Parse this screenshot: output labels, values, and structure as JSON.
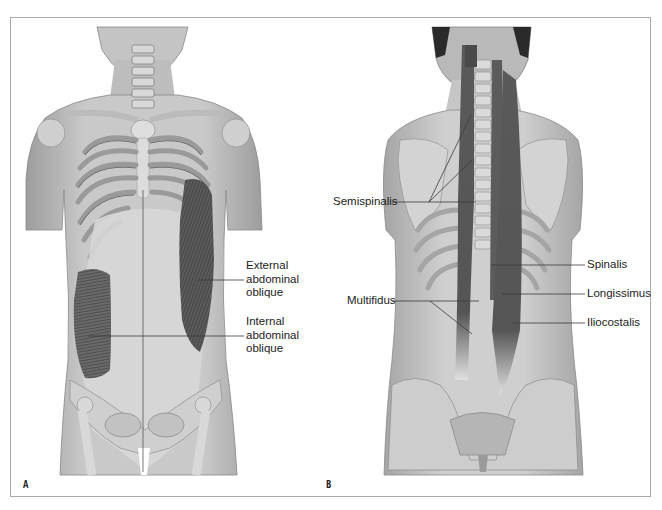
{
  "figure": {
    "panels": [
      {
        "letter": "A",
        "view": "anterior torso",
        "labels": [
          {
            "lines": [
              "External",
              "abdominal",
              "oblique"
            ],
            "text": "External abdominal oblique"
          },
          {
            "lines": [
              "Internal",
              "abdominal",
              "oblique"
            ],
            "text": "Internal abdominal oblique"
          }
        ]
      },
      {
        "letter": "B",
        "view": "posterior torso",
        "labels": [
          {
            "text": "Semispinalis"
          },
          {
            "text": "Multifidus"
          },
          {
            "text": "Spinalis"
          },
          {
            "text": "Longissimus"
          },
          {
            "text": "Iliocostalis"
          }
        ]
      }
    ]
  },
  "colors": {
    "frame_border": "#a9a9a9",
    "skin": "#bdbdbd",
    "bone": "#dcdcdc",
    "muscle_dark": "#4a4a4a",
    "leader_line": "#3a3a3a"
  }
}
